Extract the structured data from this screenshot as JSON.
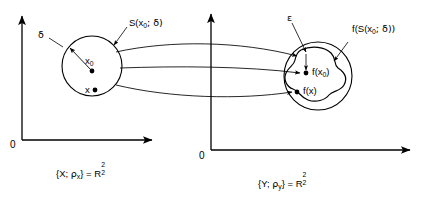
{
  "figure": {
    "type": "math-diagram"
  },
  "left_panel": {
    "origin_label": "0",
    "caption": {
      "open_brace": "{",
      "space_name": "X",
      "separator": "; ",
      "metric": "ρ",
      "metric_sub": "x",
      "close_brace": "}",
      "equals": " = ",
      "codomain": "R",
      "codomain_sup": "2",
      "codomain_sub": "2"
    },
    "ball_label": {
      "text": "S(x",
      "sub": "0",
      "tail": "; δ)"
    },
    "radius_label": "δ",
    "center_point_label": {
      "text": "x",
      "sub": "0"
    },
    "point_label": "x"
  },
  "right_panel": {
    "origin_label": "0",
    "caption": {
      "open_brace": "{",
      "space_name": "Y",
      "separator": "; ",
      "metric": "ρ",
      "metric_sub": "y",
      "close_brace": "}",
      "equals": " = ",
      "codomain": "R",
      "codomain_sup": "2",
      "codomain_sub": "2"
    },
    "epsilon_label": "ε",
    "image_set_label": {
      "text": "f(S(x",
      "sub": "0",
      "tail": "; δ))"
    },
    "center_image_label": {
      "text": "f(x",
      "sub": "0",
      "tail": ")"
    },
    "point_image_label": "f(x)"
  },
  "colors": {
    "stroke": "#000000",
    "background": "#ffffff",
    "text": "#000000"
  }
}
